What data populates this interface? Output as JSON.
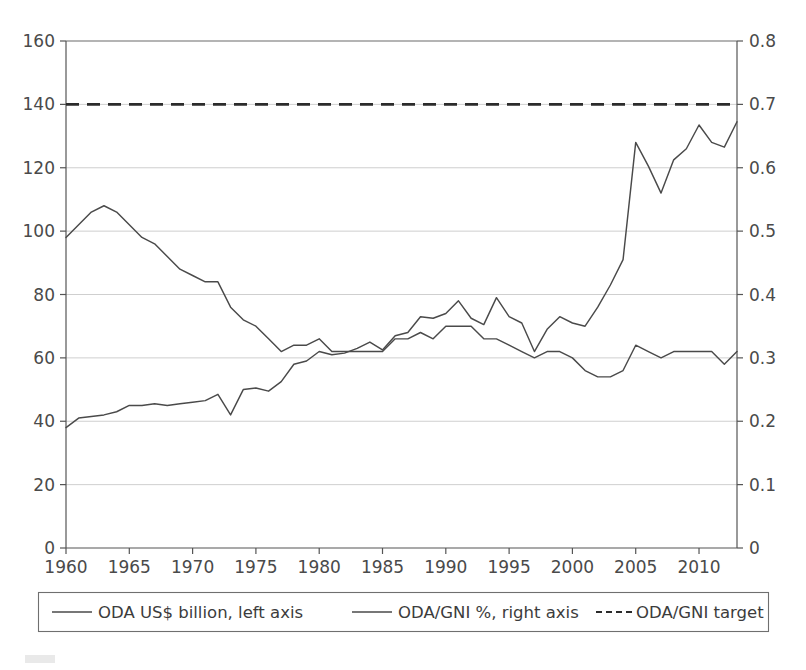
{
  "chart_data": {
    "type": "line",
    "title": "",
    "xlabel": "",
    "ylabel": "",
    "grid": true,
    "legend_position": "bottom",
    "x": [
      1960,
      1961,
      1962,
      1963,
      1964,
      1965,
      1966,
      1967,
      1968,
      1969,
      1970,
      1971,
      1972,
      1973,
      1974,
      1975,
      1976,
      1977,
      1978,
      1979,
      1980,
      1981,
      1982,
      1983,
      1984,
      1985,
      1986,
      1987,
      1988,
      1989,
      1990,
      1991,
      1992,
      1993,
      1994,
      1995,
      1996,
      1997,
      1998,
      1999,
      2000,
      2001,
      2002,
      2003,
      2004,
      2005,
      2006,
      2007,
      2008,
      2009,
      2010,
      2011,
      2012,
      2013
    ],
    "xlim": [
      1960,
      2013
    ],
    "xticks": [
      1960,
      1965,
      1970,
      1975,
      1980,
      1985,
      1990,
      1995,
      2000,
      2005,
      2010
    ],
    "left_axis": {
      "label": "ODA US$ billion",
      "ylim": [
        0,
        160
      ],
      "yticks": [
        0,
        20,
        40,
        60,
        80,
        100,
        120,
        140,
        160
      ]
    },
    "right_axis": {
      "label": "ODA/GNI %",
      "ylim": [
        0,
        0.8
      ],
      "yticks": [
        0,
        0.1,
        0.2,
        0.3,
        0.4,
        0.5,
        0.6,
        0.7,
        0.8
      ]
    },
    "series": [
      {
        "name": "ODA US$ billion, left axis",
        "axis": "left",
        "style": "solid",
        "color": "#4a4a4a",
        "values": [
          38.0,
          41.0,
          41.5,
          42.0,
          43.0,
          45.0,
          45.0,
          45.5,
          45.0,
          45.5,
          46.0,
          46.5,
          48.5,
          42.0,
          50.0,
          50.5,
          49.5,
          52.5,
          58.0,
          59.0,
          62.0,
          61.0,
          61.5,
          63.0,
          65.0,
          62.5,
          67.0,
          68.0,
          73.0,
          72.5,
          74.0,
          78.0,
          72.5,
          70.5,
          79.0,
          73.0,
          71.0,
          62.0,
          69.0,
          73.0,
          71.0,
          70.0,
          76.0,
          83.0,
          91.0,
          128.0,
          120.5,
          112.0,
          122.5,
          126.0,
          133.5,
          128.0,
          126.5,
          134.5
        ]
      },
      {
        "name": "ODA/GNI %, right axis",
        "axis": "right",
        "style": "solid",
        "color": "#4a4a4a",
        "values": [
          0.49,
          0.51,
          0.53,
          0.54,
          0.53,
          0.51,
          0.49,
          0.48,
          0.46,
          0.44,
          0.43,
          0.42,
          0.42,
          0.38,
          0.36,
          0.35,
          0.33,
          0.31,
          0.32,
          0.32,
          0.33,
          0.31,
          0.31,
          0.31,
          0.31,
          0.31,
          0.33,
          0.33,
          0.34,
          0.33,
          0.35,
          0.35,
          0.35,
          0.33,
          0.33,
          0.32,
          0.31,
          0.3,
          0.31,
          0.31,
          0.3,
          0.28,
          0.27,
          0.27,
          0.28,
          0.32,
          0.31,
          0.3,
          0.31,
          0.31,
          0.31,
          0.31,
          0.29,
          0.31
        ]
      },
      {
        "name": "ODA/GNI target",
        "axis": "right",
        "style": "dashed",
        "color": "#2b2b2b",
        "constant_value": 0.7
      }
    ]
  },
  "legend": {
    "items": [
      {
        "label": "ODA US$ billion, left axis",
        "style": "solid"
      },
      {
        "label": "ODA/GNI %, right axis",
        "style": "solid"
      },
      {
        "label": "ODA/GNI target",
        "style": "dashed"
      }
    ]
  },
  "axis_labels": {
    "left": [
      "160",
      "140",
      "120",
      "100",
      "80",
      "60",
      "40",
      "20",
      "0"
    ],
    "right": [
      "0.8",
      "0.7",
      "0.6",
      "0.5",
      "0.4",
      "0.3",
      "0.2",
      "0.1",
      "0"
    ],
    "bottom": [
      "1960",
      "1965",
      "1970",
      "1975",
      "1980",
      "1985",
      "1990",
      "1995",
      "2000",
      "2005",
      "2010"
    ]
  },
  "colors": {
    "series_line": "#4a4a4a",
    "target_line": "#2b2b2b",
    "grid": "#c9c9c9",
    "axis": "#555555",
    "background": "#ffffff"
  }
}
